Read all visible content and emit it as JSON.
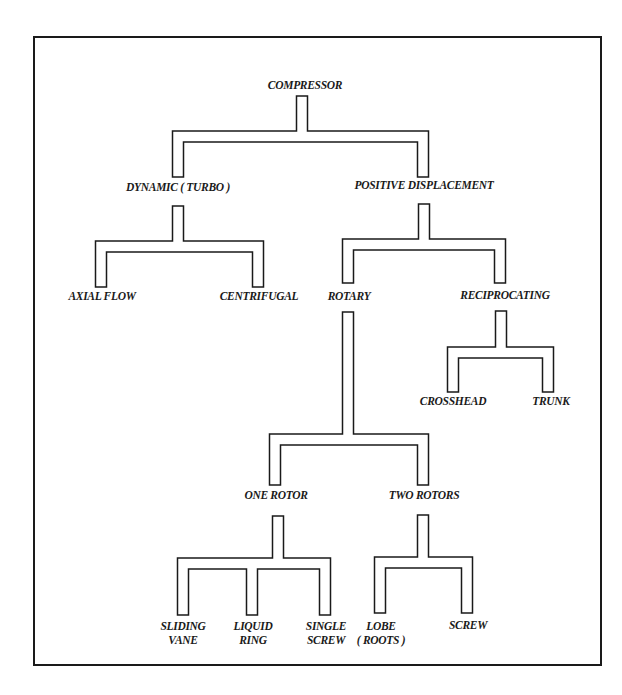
{
  "diagram": {
    "root": "COMPRESSOR",
    "nodes": [
      {
        "id": "compressor",
        "lines": [
          "COMPRESSOR"
        ],
        "x": 305,
        "y": 84
      },
      {
        "id": "dynamic",
        "lines": [
          "DYNAMIC ( TURBO )"
        ],
        "x": 178,
        "y": 186
      },
      {
        "id": "positive-displacement",
        "lines": [
          "POSITIVE DISPLACEMENT"
        ],
        "x": 424,
        "y": 184
      },
      {
        "id": "axial-flow",
        "lines": [
          "AXIAL FLOW"
        ],
        "x": 102,
        "y": 295
      },
      {
        "id": "centrifugal",
        "lines": [
          "CENTRIFUGAL"
        ],
        "x": 259,
        "y": 295
      },
      {
        "id": "rotary",
        "lines": [
          "ROTARY"
        ],
        "x": 349,
        "y": 295
      },
      {
        "id": "reciprocating",
        "lines": [
          "RECIPROCATING"
        ],
        "x": 505,
        "y": 294
      },
      {
        "id": "crosshead",
        "lines": [
          "CROSSHEAD"
        ],
        "x": 453,
        "y": 400
      },
      {
        "id": "trunk",
        "lines": [
          "TRUNK"
        ],
        "x": 551,
        "y": 400
      },
      {
        "id": "one-rotor",
        "lines": [
          "ONE ROTOR"
        ],
        "x": 276,
        "y": 494
      },
      {
        "id": "two-rotors",
        "lines": [
          "TWO ROTORS"
        ],
        "x": 424,
        "y": 494
      },
      {
        "id": "sliding-vane",
        "lines": [
          "SLIDING",
          "VANE"
        ],
        "x": 183,
        "y": 625
      },
      {
        "id": "liquid-ring",
        "lines": [
          "LIQUID",
          "RING"
        ],
        "x": 253,
        "y": 625
      },
      {
        "id": "single-screw",
        "lines": [
          "SINGLE",
          "SCREW"
        ],
        "x": 326,
        "y": 625
      },
      {
        "id": "lobe-roots",
        "lines": [
          "LOBE",
          "( ROOTS )"
        ],
        "x": 381,
        "y": 625
      },
      {
        "id": "screw",
        "lines": [
          "SCREW"
        ],
        "x": 468,
        "y": 624
      }
    ],
    "edges": [
      {
        "parent": "compressor",
        "children": [
          "dynamic",
          "positive-displacement"
        ]
      },
      {
        "parent": "dynamic",
        "children": [
          "axial-flow",
          "centrifugal"
        ]
      },
      {
        "parent": "positive-displacement",
        "children": [
          "rotary",
          "reciprocating"
        ]
      },
      {
        "parent": "reciprocating",
        "children": [
          "crosshead",
          "trunk"
        ]
      },
      {
        "parent": "rotary",
        "children": [
          "one-rotor",
          "two-rotors"
        ]
      },
      {
        "parent": "one-rotor",
        "children": [
          "sliding-vane",
          "liquid-ring",
          "single-screw"
        ]
      },
      {
        "parent": "two-rotors",
        "children": [
          "lobe-roots",
          "screw"
        ]
      }
    ],
    "connectors": [
      {
        "id": "compressor-branch",
        "stem_x": 302,
        "stem_top": 96,
        "bar_top": 131,
        "legs_x": [
          178,
          423
        ],
        "leg_bottom": 177
      },
      {
        "id": "dynamic-branch",
        "stem_x": 178,
        "stem_top": 206,
        "bar_top": 241,
        "legs_x": [
          101,
          258
        ],
        "leg_bottom": 287
      },
      {
        "id": "pd-branch",
        "stem_x": 424,
        "stem_top": 204,
        "bar_top": 239,
        "legs_x": [
          348,
          500
        ],
        "leg_bottom": 283
      },
      {
        "id": "reciprocating-branch",
        "stem_x": 501,
        "stem_top": 311,
        "bar_top": 347,
        "legs_x": [
          453,
          548
        ],
        "leg_bottom": 392
      },
      {
        "id": "rotary-branch",
        "stem_x": 348,
        "stem_top": 312,
        "bar_top": 434,
        "legs_x": [
          275,
          423
        ],
        "leg_bottom": 485
      },
      {
        "id": "one-rotor-branch",
        "stem_x": 278,
        "stem_top": 516,
        "bar_top": 558,
        "legs_x": [
          183,
          252,
          325
        ],
        "leg_bottom": 615
      },
      {
        "id": "two-rotors-branch",
        "stem_x": 423,
        "stem_top": 515,
        "bar_top": 557,
        "legs_x": [
          380,
          467
        ],
        "leg_bottom": 613
      }
    ],
    "pipe_width": 11,
    "colors": {
      "ink": "#1a1a1a",
      "paper": "#ffffff"
    }
  }
}
